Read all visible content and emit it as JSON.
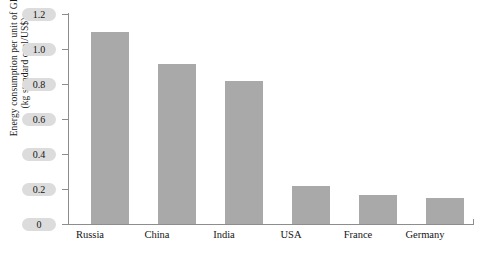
{
  "chart_data": {
    "type": "bar",
    "title": "",
    "xlabel": "",
    "ylabel": "Energy consumption per unit of GDP (kg standard coal/US$)",
    "ylabel_lines": [
      "Energy consumption per unit of GDP",
      "(kg standard coal/US$)"
    ],
    "categories": [
      "Russia",
      "China",
      "India",
      "USA",
      "France",
      "Germany"
    ],
    "values": [
      1.1,
      0.915,
      0.815,
      0.215,
      0.165,
      0.15
    ],
    "ylim": [
      0,
      1.2
    ],
    "ytick_labels": [
      "1.2",
      "1.0",
      "0.8",
      "0.6",
      "0.4",
      "0.2",
      "0"
    ],
    "ytick_values": [
      1.2,
      1.0,
      0.8,
      0.6,
      0.4,
      0.2,
      0
    ],
    "grid": false,
    "legend": null,
    "bar_color": "#a9a9a9",
    "axis_color": "#8d8d8d",
    "tick_label_highlight_color": "#dcdcdc",
    "background_color": "#ffffff"
  }
}
